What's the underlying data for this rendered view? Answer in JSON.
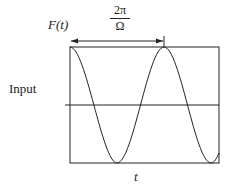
{
  "diagram": {
    "y_label": "F(t)",
    "x_label": "t",
    "side_label": "Input",
    "period_numerator": "2π",
    "period_denominator": "Ω",
    "colors": {
      "line": "#222222",
      "background": "#ffffff"
    },
    "waveform": {
      "type": "cosine",
      "cycles_shown": 1.6,
      "starts_at": "peak",
      "period_annotation": "2π/Ω"
    }
  }
}
